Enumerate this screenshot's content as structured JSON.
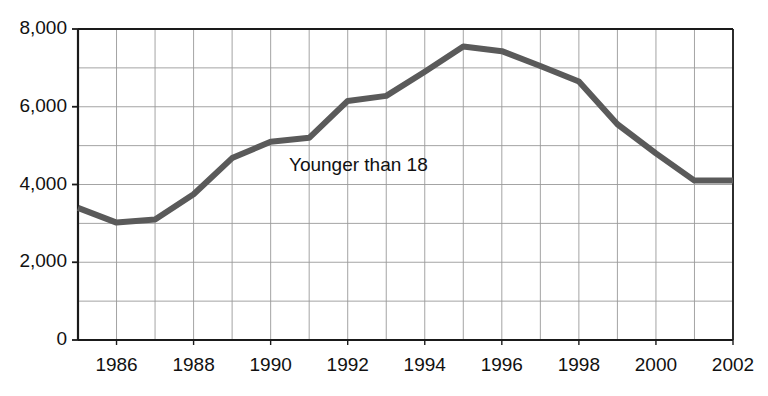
{
  "chart_data": {
    "type": "line",
    "title": "",
    "subtitle": "",
    "xlabel": "",
    "ylabel": "",
    "x": [
      1985,
      1986,
      1987,
      1988,
      1989,
      1990,
      1991,
      1992,
      1993,
      1994,
      1995,
      1996,
      1997,
      1998,
      1999,
      2000,
      2001,
      2002
    ],
    "series": [
      {
        "name": "Younger than 18",
        "values": [
          3400,
          3020,
          3100,
          3750,
          4680,
          5100,
          5200,
          6150,
          6280,
          6900,
          7550,
          7430,
          7050,
          6650,
          5550,
          4800,
          4100,
          4100
        ]
      }
    ],
    "categories": [
      "1985",
      "1986",
      "1987",
      "1988",
      "1989",
      "1990",
      "1991",
      "1992",
      "1993",
      "1994",
      "1995",
      "1996",
      "1997",
      "1998",
      "1999",
      "2000",
      "2001",
      "2002"
    ],
    "xlim": [
      1985,
      2002
    ],
    "ylim": [
      0,
      8000
    ],
    "y_ticks": [
      0,
      2000,
      4000,
      6000,
      8000
    ],
    "y_tick_labels": [
      "0",
      "2,000",
      "4,000",
      "6,000",
      "8,000"
    ],
    "y_minor_tick_step": 1000,
    "x_ticks": [
      1986,
      1988,
      1990,
      1992,
      1994,
      1996,
      1998,
      2000,
      2002
    ],
    "x_tick_labels": [
      "1986",
      "1988",
      "1990",
      "1992",
      "1994",
      "1996",
      "1998",
      "2000",
      "2002"
    ],
    "grid": true,
    "legend": "none",
    "annotations": [
      {
        "text": "Younger than 18",
        "x": 1992.5,
        "y": 4450
      }
    ],
    "colors": {
      "line": "#5a5a5a",
      "axis": "#1a1a1a",
      "grid": "#9a9a9a",
      "background": "#ffffff",
      "text": "#111111"
    },
    "line_width": 6
  }
}
